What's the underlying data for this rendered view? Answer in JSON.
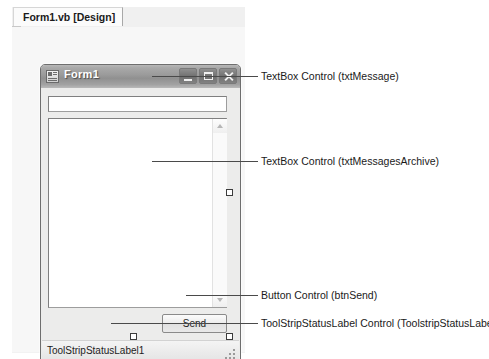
{
  "designer": {
    "tab_label": "Form1.vb [Design]"
  },
  "form": {
    "title": "Form1",
    "icon": "form-window-icon",
    "window_buttons": {
      "minimize": "minimize-icon",
      "maximize": "maximize-icon",
      "close": "close-icon"
    },
    "controls": {
      "txt_message": {
        "name": "txtMessage",
        "value": "",
        "placeholder": ""
      },
      "txt_messages_archive": {
        "name": "txtMessagesArchive",
        "value": "",
        "placeholder": "",
        "scrollbar": {
          "up_arrow": "scroll-up-icon",
          "down_arrow": "scroll-down-icon"
        }
      },
      "btn_send": {
        "name": "btnSend",
        "label": "Send"
      },
      "status_strip": {
        "label": "ToolStripStatusLabel1",
        "grip": "resize-grip-icon"
      }
    }
  },
  "callouts": [
    {
      "text": "TextBox Control (txtMessage)"
    },
    {
      "text": "TextBox Control (txtMessagesArchive)"
    },
    {
      "text": "Button Control (btnSend)"
    },
    {
      "text": "ToolStripStatusLabel Control (ToolstripStatusLabel1)"
    }
  ],
  "colors": {
    "titlebar": "#9b9b9b",
    "form_background": "#ececeb",
    "callout_line": "#4a4a4a",
    "text": "#1a1a1a"
  }
}
